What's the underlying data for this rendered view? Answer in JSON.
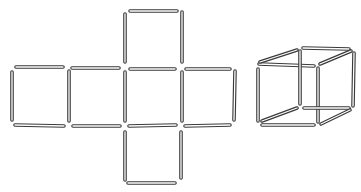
{
  "diagram": {
    "type": "matchstick-puzzle",
    "stroke_color": "#3a3a3a",
    "background": "#ffffff",
    "figures": [
      {
        "name": "cross-net",
        "description": "Six matchstick squares arranged as a cross (cube net)",
        "stick_count": 17,
        "sticks": [
          {
            "x1": 130,
            "y1": 11,
            "x2": 177,
            "y2": 11
          },
          {
            "x1": 125,
            "y1": 14,
            "x2": 125,
            "y2": 62
          },
          {
            "x1": 182,
            "y1": 12,
            "x2": 182,
            "y2": 62
          },
          {
            "x1": 16,
            "y1": 67,
            "x2": 63,
            "y2": 67
          },
          {
            "x1": 72,
            "y1": 68,
            "x2": 119,
            "y2": 68
          },
          {
            "x1": 130,
            "y1": 69,
            "x2": 175,
            "y2": 69
          },
          {
            "x1": 186,
            "y1": 69,
            "x2": 230,
            "y2": 69
          },
          {
            "x1": 12,
            "y1": 72,
            "x2": 12,
            "y2": 120
          },
          {
            "x1": 69,
            "y1": 71,
            "x2": 69,
            "y2": 121
          },
          {
            "x1": 125,
            "y1": 72,
            "x2": 125,
            "y2": 121
          },
          {
            "x1": 182,
            "y1": 72,
            "x2": 182,
            "y2": 121
          },
          {
            "x1": 235,
            "y1": 71,
            "x2": 234,
            "y2": 120
          },
          {
            "x1": 15,
            "y1": 125,
            "x2": 64,
            "y2": 126
          },
          {
            "x1": 73,
            "y1": 126,
            "x2": 120,
            "y2": 126
          },
          {
            "x1": 129,
            "y1": 126,
            "x2": 176,
            "y2": 125
          },
          {
            "x1": 185,
            "y1": 126,
            "x2": 230,
            "y2": 125
          },
          {
            "x1": 125,
            "y1": 132,
            "x2": 125,
            "y2": 180
          },
          {
            "x1": 181,
            "y1": 132,
            "x2": 181,
            "y2": 178
          },
          {
            "x1": 128,
            "y1": 183,
            "x2": 175,
            "y2": 183
          }
        ]
      },
      {
        "name": "cube",
        "description": "Matchstick box in perspective",
        "stick_count": 12,
        "sticks": [
          {
            "x1": 259,
            "y1": 64,
            "x2": 314,
            "y2": 66
          },
          {
            "x1": 258,
            "y1": 69,
            "x2": 258,
            "y2": 121
          },
          {
            "x1": 318,
            "y1": 68,
            "x2": 318,
            "y2": 122
          },
          {
            "x1": 262,
            "y1": 125,
            "x2": 314,
            "y2": 125
          },
          {
            "x1": 303,
            "y1": 48,
            "x2": 349,
            "y2": 49
          },
          {
            "x1": 300,
            "y1": 51,
            "x2": 300,
            "y2": 104
          },
          {
            "x1": 354,
            "y1": 53,
            "x2": 353,
            "y2": 106
          },
          {
            "x1": 304,
            "y1": 108,
            "x2": 349,
            "y2": 108
          },
          {
            "x1": 260,
            "y1": 62,
            "x2": 297,
            "y2": 50
          },
          {
            "x1": 320,
            "y1": 64,
            "x2": 351,
            "y2": 51
          },
          {
            "x1": 262,
            "y1": 121,
            "x2": 297,
            "y2": 108
          },
          {
            "x1": 321,
            "y1": 124,
            "x2": 350,
            "y2": 110
          }
        ]
      }
    ]
  }
}
